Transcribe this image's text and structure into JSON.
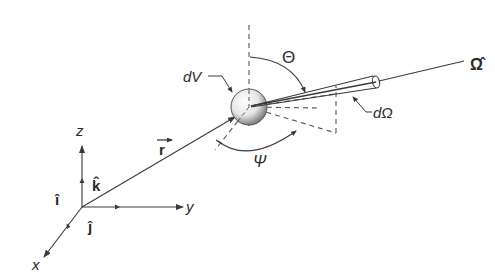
{
  "figure": {
    "type": "neutron-transport-geometry",
    "labels": {
      "volume_element": "dV",
      "solid_angle": "dΩ",
      "direction": "Ω̂",
      "polar_angle": "Θ",
      "azimuthal_angle": "Ψ",
      "position_vector": "r",
      "axis_x": "x",
      "axis_y": "y",
      "axis_z": "z",
      "unit_i": "î",
      "unit_j": "ĵ",
      "unit_k": "k̂"
    },
    "colors": {
      "line": "#3a3a3a",
      "text": "#2a2a2a",
      "background": "#ffffff"
    }
  }
}
